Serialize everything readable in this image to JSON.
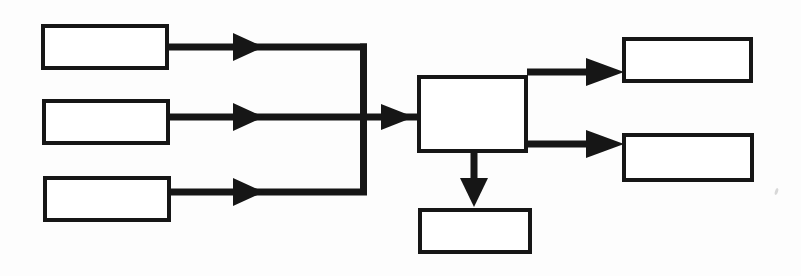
{
  "diagram": {
    "title": "",
    "type": "flowchart",
    "orientation": "left-to-right",
    "canvas": {
      "width": 801,
      "height": 276
    },
    "style": {
      "background_color": "#fdfdfd",
      "box_fill_color": "#ffffff",
      "line_color": "#161616",
      "box_border_color": "#161616",
      "border_width_px": 4,
      "connector_width_px": 7
    },
    "nodes": [
      {
        "id": "input-1",
        "role": "input",
        "label": "",
        "x": 41,
        "y": 24,
        "width": 128,
        "height": 46
      },
      {
        "id": "input-2",
        "role": "input",
        "label": "",
        "x": 42,
        "y": 99,
        "width": 128,
        "height": 46
      },
      {
        "id": "input-3",
        "role": "input",
        "label": "",
        "x": 43,
        "y": 176,
        "width": 128,
        "height": 46
      },
      {
        "id": "process-central",
        "role": "process",
        "label": "",
        "x": 417,
        "y": 75,
        "width": 111,
        "height": 78
      },
      {
        "id": "output-top",
        "role": "output",
        "label": "",
        "x": 622,
        "y": 37,
        "width": 131,
        "height": 46
      },
      {
        "id": "output-bottom",
        "role": "output",
        "label": "",
        "x": 622,
        "y": 133,
        "width": 132,
        "height": 49
      },
      {
        "id": "output-below",
        "role": "output",
        "label": "",
        "x": 418,
        "y": 208,
        "width": 114,
        "height": 46
      }
    ],
    "connectors": [
      {
        "id": "connector-input-1-to-process",
        "from": "input-1",
        "to": "process-central",
        "path": "horizontal-then-down-then-right",
        "has_arrowhead": true,
        "arrowhead_midline_x": 248,
        "y": 47
      },
      {
        "id": "connector-input-2-to-process",
        "from": "input-2",
        "to": "process-central",
        "path": "horizontal",
        "has_arrowhead": true,
        "arrowhead_midline_x": 248,
        "y": 117
      },
      {
        "id": "connector-input-3-to-process",
        "from": "input-3",
        "to": "process-central",
        "path": "horizontal-then-up-then-right",
        "has_arrowhead": true,
        "arrowhead_midline_x": 248,
        "y": 192
      },
      {
        "id": "connector-merge-to-process",
        "from": "merge-junction",
        "to": "process-central",
        "path": "horizontal",
        "has_arrowhead": true,
        "y": 117
      },
      {
        "id": "connector-process-to-output-top",
        "from": "process-central",
        "to": "output-top",
        "path": "horizontal",
        "has_arrowhead": true,
        "y": 72
      },
      {
        "id": "connector-process-to-output-bottom",
        "from": "process-central",
        "to": "output-bottom",
        "path": "horizontal",
        "has_arrowhead": true,
        "y": 144
      },
      {
        "id": "connector-process-to-output-below",
        "from": "process-central",
        "to": "output-below",
        "path": "vertical-down",
        "has_arrowhead": true,
        "x": 474
      }
    ],
    "merge_bus": {
      "id": "merge-bus",
      "description": "vertical bus joining the three input arrows",
      "x": 363,
      "y_top": 43,
      "y_bottom": 192
    }
  }
}
